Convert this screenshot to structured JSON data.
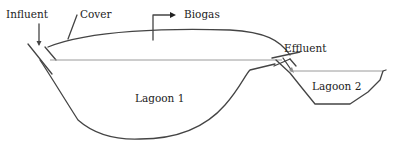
{
  "diagram": {
    "labels": {
      "influent": "Influent",
      "cover": "Cover",
      "biogas": "Biogas",
      "effluent": "Effluent",
      "lagoon1": "Lagoon 1",
      "lagoon2": "Lagoon 2"
    },
    "colors": {
      "outline": "#444444",
      "water_line": "#9a9a9a",
      "text": "#222222"
    }
  }
}
